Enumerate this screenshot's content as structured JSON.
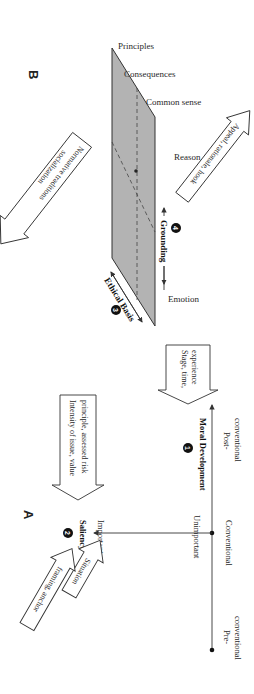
{
  "panels": {
    "A": {
      "label": "A",
      "moral_development": {
        "number": "1",
        "title": "Moral Development",
        "stages": [
          "Pre-",
          "conventional",
          "Conventional",
          "Post-",
          "conventional"
        ],
        "input_arrow": [
          "Stage, time,",
          "experience"
        ]
      },
      "saliency": {
        "number": "2",
        "title": "Saliency",
        "important": "Important",
        "unimportant": "Unimportant",
        "input_arrow": [
          "Intensity of issue, value",
          "principle, assessed risk"
        ],
        "situation_arrow": "Situation",
        "framing_arrow": "framing, anchor"
      }
    },
    "B": {
      "label": "B",
      "ethical_basis": {
        "number": "3",
        "title": "Ethical Basis",
        "input_arrow": [
          "Normative traditions",
          "socialization"
        ],
        "emotion": "Emotion",
        "levels": [
          "Principles",
          "Consequences",
          "Common sense"
        ]
      },
      "grounding": {
        "number": "4",
        "title": "Grounding",
        "reason": "Reason",
        "input_arrow": "Appeal, rationale, hook"
      }
    }
  },
  "colors": {
    "plane_fill": "#b3b3b3",
    "line": "#333333",
    "text": "#2a2a2a"
  }
}
